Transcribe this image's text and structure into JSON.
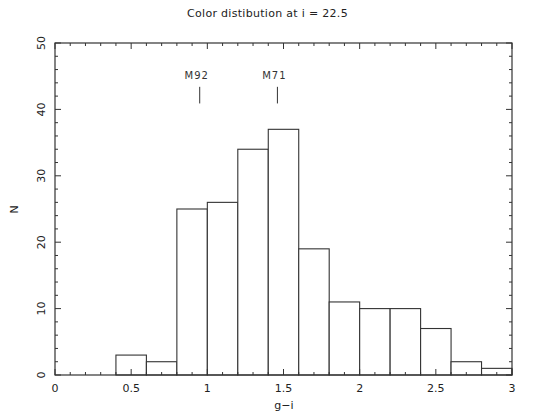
{
  "chart_data": {
    "type": "bar",
    "subtype": "histogram",
    "title": "Color distibution at i = 22.5",
    "xlabel": "g−i",
    "ylabel": "N",
    "xlim": [
      0,
      3
    ],
    "ylim": [
      0,
      50
    ],
    "bin_width": 0.2,
    "bin_edges": [
      0.4,
      0.6,
      0.8,
      1.0,
      1.2,
      1.4,
      1.6,
      1.8,
      2.0,
      2.2,
      2.4,
      2.6,
      2.8,
      3.0
    ],
    "categories": [
      "0.4-0.6",
      "0.6-0.8",
      "0.8-1.0",
      "1.0-1.2",
      "1.2-1.4",
      "1.4-1.6",
      "1.6-1.8",
      "1.8-2.0",
      "2.0-2.2",
      "2.2-2.4",
      "2.4-2.6",
      "2.6-2.8",
      "2.8-3.0"
    ],
    "values": [
      3,
      2,
      25,
      26,
      34,
      37,
      19,
      11,
      10,
      10,
      7,
      2,
      1
    ],
    "x_ticks": [
      "0",
      "0.5",
      "1",
      "1.5",
      "2",
      "2.5",
      "3"
    ],
    "x_tick_values": [
      0,
      0.5,
      1,
      1.5,
      2,
      2.5,
      3
    ],
    "y_ticks": [
      "0",
      "10",
      "20",
      "30",
      "40",
      "50"
    ],
    "y_tick_values": [
      0,
      10,
      20,
      30,
      40,
      50
    ],
    "grid": false,
    "legend": null,
    "annotations": [
      {
        "label": "M92",
        "x": 0.95,
        "y_top": 44,
        "y_bottom": 41.5
      },
      {
        "label": "M71",
        "x": 1.46,
        "y_top": 44,
        "y_bottom": 41.5
      }
    ],
    "colors": {
      "bar_fill": "#ffffff",
      "bar_edge": "#333333",
      "axis": "#333333"
    }
  }
}
